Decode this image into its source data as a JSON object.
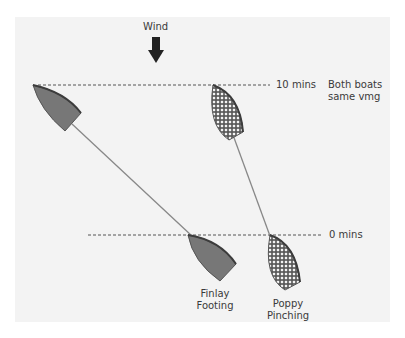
{
  "diagram": {
    "wind_label": "Wind",
    "lines": {
      "top": {
        "label": "10 mins",
        "note_line1": "Both boats",
        "note_line2": "same vmg"
      },
      "bottom": {
        "label": "0 mins"
      }
    },
    "boats": [
      {
        "name_line1": "Finlay",
        "name_line2": "Footing",
        "style": "solid-gray"
      },
      {
        "name_line1": "Poppy",
        "name_line2": "Pinching",
        "style": "checkered"
      }
    ],
    "colors": {
      "panel_bg": "#f3f3f3",
      "hull_fill": "#777777",
      "hull_edge": "#444444",
      "track": "#888888",
      "dash": "#555555"
    }
  }
}
